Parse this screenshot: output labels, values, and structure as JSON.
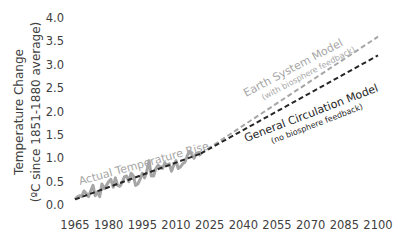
{
  "chart_data": {
    "type": "line",
    "title": "",
    "xlabel": "",
    "ylabel": "Temperature Change",
    "ylabel_sub": "(ºC since 1851-1880 average)",
    "xlim": [
      1965,
      2100
    ],
    "ylim": [
      0.0,
      4.0
    ],
    "x_ticks": [
      "1965",
      "1980",
      "1995",
      "2010",
      "2025",
      "2040",
      "2055",
      "2070",
      "2085",
      "2100"
    ],
    "y_ticks": [
      "0.0",
      "0.5",
      "1.0",
      "1.5",
      "2.0",
      "2.5",
      "3.0",
      "3.5",
      "4.0"
    ],
    "grid": false,
    "legend": "none (inline annotations)",
    "series": [
      {
        "name": "Actual Temperature Rise",
        "style": "solid",
        "color": "#a6a6a6",
        "x": [
          1965,
          1966,
          1967,
          1968,
          1969,
          1970,
          1971,
          1972,
          1973,
          1974,
          1975,
          1976,
          1977,
          1978,
          1979,
          1980,
          1981,
          1982,
          1983,
          1984,
          1985,
          1986,
          1987,
          1988,
          1989,
          1990,
          1991,
          1992,
          1993,
          1994,
          1995,
          1996,
          1997,
          1998,
          1999,
          2000,
          2001,
          2002,
          2003,
          2004,
          2005,
          2006,
          2007,
          2008,
          2009,
          2010,
          2011,
          2012,
          2013,
          2014,
          2015,
          2016,
          2017,
          2018,
          2019,
          2020,
          2021
        ],
        "values": [
          0.12,
          0.17,
          0.2,
          0.18,
          0.3,
          0.25,
          0.18,
          0.3,
          0.42,
          0.2,
          0.28,
          0.18,
          0.45,
          0.35,
          0.42,
          0.5,
          0.55,
          0.38,
          0.58,
          0.42,
          0.4,
          0.48,
          0.6,
          0.62,
          0.5,
          0.68,
          0.62,
          0.42,
          0.45,
          0.55,
          0.68,
          0.58,
          0.72,
          0.95,
          0.62,
          0.62,
          0.78,
          0.85,
          0.82,
          0.78,
          0.9,
          0.85,
          0.88,
          0.72,
          0.85,
          0.95,
          0.78,
          0.82,
          0.88,
          0.92,
          1.05,
          1.15,
          1.08,
          1.0,
          1.1,
          1.12,
          1.05
        ]
      },
      {
        "name": "Trend (historical)",
        "style": "dashed",
        "color": "#262626",
        "x": [
          1965,
          2021
        ],
        "values": [
          0.12,
          1.1
        ]
      },
      {
        "name": "Earth System Model (with biosphere feedback)",
        "style": "dashed",
        "color": "#a6a6a6",
        "x": [
          2021,
          2100
        ],
        "values": [
          1.1,
          3.6
        ]
      },
      {
        "name": "General Circulation Model (no biosphere feedback)",
        "style": "dashed",
        "color": "#262626",
        "x": [
          2021,
          2100
        ],
        "values": [
          1.1,
          3.2
        ]
      }
    ],
    "annotations": [
      {
        "text": "Actual Temperature Rise",
        "color": "#a6a6a6"
      },
      {
        "text": "Earth System Model",
        "sub": "(with biosphere feedback)",
        "color": "#a6a6a6"
      },
      {
        "text": "General Circulation Model",
        "sub": "(no biosphere feedback)",
        "color": "#262626"
      }
    ]
  },
  "labels": {
    "ylabel_line1": "Temperature Change",
    "ylabel_line2": "(ºC since 1851-1880 average)",
    "actual": "Actual Temperature Rise",
    "esm": "Earth System Model",
    "esm_sub": "(with biosphere feedback)",
    "gcm": "General Circulation Model",
    "gcm_sub": "(no biosphere feedback)"
  }
}
